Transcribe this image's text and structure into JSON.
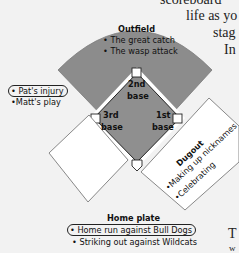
{
  "page_text": {
    "line1": "scoreboard",
    "line2": "life as yo",
    "line3": "stag",
    "line4": "In",
    "line5": "T",
    "line6": "w"
  },
  "diagram": {
    "outfield": {
      "label": "Outfield",
      "items": [
        "• The great catch",
        "• The wasp attack"
      ]
    },
    "bases": {
      "second": [
        "2nd",
        "base"
      ],
      "third": [
        "3rd",
        "base"
      ],
      "first": [
        "1st",
        "base"
      ]
    },
    "left_notes": {
      "items": [
        "• Pat's injury",
        "•Matt's play"
      ],
      "circled_index": 0
    },
    "dugout": {
      "label": "Dugout",
      "items": [
        "•Making up nicknames",
        "•Celebrating"
      ]
    },
    "left_box": {
      "items": []
    },
    "home_plate": {
      "label": "Home plate",
      "items": [
        "• Home run against Bull Dogs",
        "• Striking out against Wildcats"
      ],
      "circled_index": 0
    },
    "colors": {
      "background": "#f2f2f2",
      "field_gray": "#8c8c8c",
      "infield_gray": "#909090",
      "line_white": "#ffffff",
      "outline": "#222222",
      "box_fill": "#ffffff"
    }
  }
}
